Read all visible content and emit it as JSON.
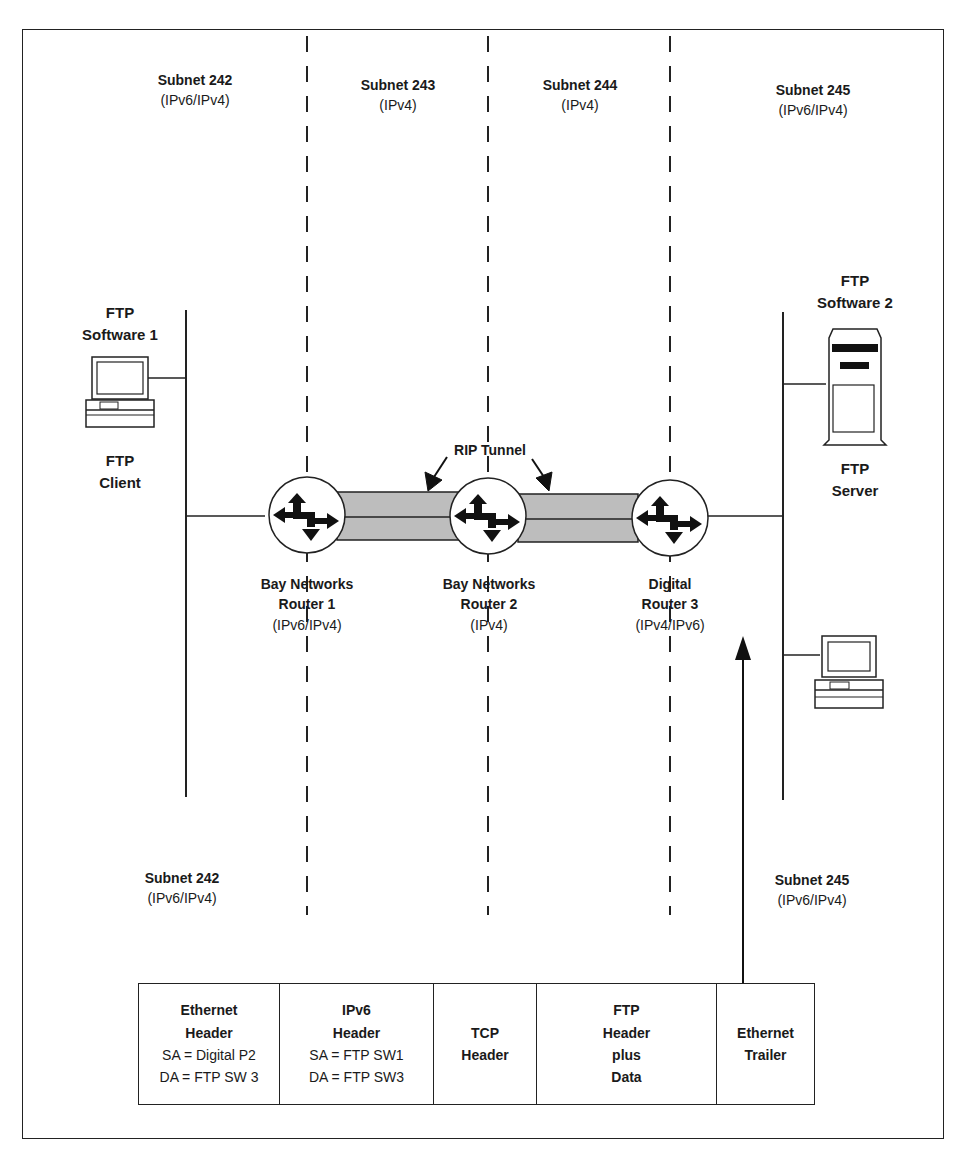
{
  "subnets_top": [
    {
      "name": "Subnet 242",
      "proto": "(IPv6/IPv4)"
    },
    {
      "name": "Subnet 243",
      "proto": "(IPv4)"
    },
    {
      "name": "Subnet 244",
      "proto": "(IPv4)"
    },
    {
      "name": "Subnet 245",
      "proto": "(IPv6/IPv4)"
    }
  ],
  "subnets_bottom": [
    {
      "name": "Subnet 242",
      "proto": "(IPv6/IPv4)"
    },
    {
      "name": "Subnet 245",
      "proto": "(IPv6/IPv4)"
    }
  ],
  "client": {
    "software": [
      "FTP",
      "Software 1"
    ],
    "role": [
      "FTP",
      "Client"
    ]
  },
  "server": {
    "software": [
      "FTP",
      "Software 2"
    ],
    "role": [
      "FTP",
      "Server"
    ]
  },
  "tunnel": {
    "label": "RIP Tunnel",
    "fill": "#bdbdbd"
  },
  "routers": [
    {
      "vendor": "Bay Networks",
      "name": "Router 1",
      "proto": "(IPv6/IPv4)"
    },
    {
      "vendor": "Bay Networks",
      "name": "Router 2",
      "proto": "(IPv4)"
    },
    {
      "vendor": "Digital",
      "name": "Router 3",
      "proto": "(IPv4/IPv6)"
    }
  ],
  "packet": [
    {
      "title": [
        "Ethernet",
        "Header"
      ],
      "lines": [
        "SA = Digital P2",
        "DA = FTP SW 3"
      ]
    },
    {
      "title": [
        "IPv6",
        "Header"
      ],
      "lines": [
        "SA = FTP SW1",
        "DA = FTP SW3"
      ]
    },
    {
      "title": [
        "TCP",
        "Header"
      ],
      "lines": []
    },
    {
      "title": [
        "FTP",
        "Header",
        "plus",
        "Data"
      ],
      "lines": []
    },
    {
      "title": [
        "Ethernet",
        "Trailer"
      ],
      "lines": []
    }
  ]
}
